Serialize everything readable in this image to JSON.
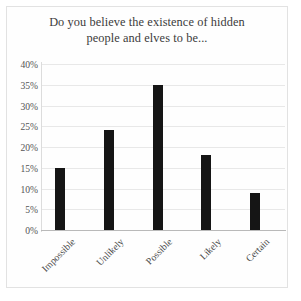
{
  "chart_data": {
    "type": "bar",
    "title": "Do you believe the existence of hidden people and elves to be...",
    "title_line1": "Do you believe the existence of hidden",
    "title_line2": "people and elves to be...",
    "categories": [
      "Impossible",
      "Unlikely",
      "Possible",
      "Likely",
      "Certain"
    ],
    "values": [
      15,
      24,
      35,
      18,
      9
    ],
    "value_labels": [
      "15%",
      "24%",
      "35%",
      "18%",
      "9%"
    ],
    "xlabel": "",
    "ylabel": "",
    "ylim": [
      0,
      40
    ],
    "ytick_values": [
      0,
      5,
      10,
      15,
      20,
      25,
      30,
      35,
      40
    ],
    "ytick_labels": [
      "0%",
      "5%",
      "10%",
      "15%",
      "20%",
      "25%",
      "30%",
      "35%",
      "40%"
    ],
    "grid": true,
    "legend": false,
    "legend_position": "none",
    "bar_color": "#151515",
    "gridline_color": "#e8e8e8",
    "axis_color": "#b9b9b9",
    "background_color": "#ffffff",
    "text_color": "#3b3b3b"
  }
}
